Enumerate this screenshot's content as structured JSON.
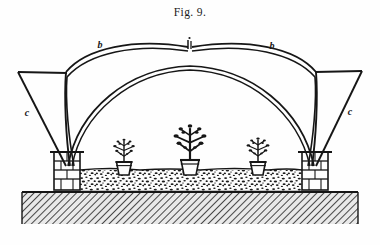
{
  "figure": {
    "caption": "Fig. 9.",
    "medium": "line-engraving",
    "ink_color": "#171717",
    "paper_color": "#fefefe"
  },
  "labels": [
    {
      "id": "b-left",
      "text": "b",
      "x": 100,
      "y": 48,
      "refers_to": "outer-arch-rib-left"
    },
    {
      "id": "b-right",
      "text": "b",
      "x": 272,
      "y": 49,
      "refers_to": "outer-arch-rib-right"
    },
    {
      "id": "c-left",
      "text": "c",
      "x": 27,
      "y": 116,
      "refers_to": "straight-strut-left"
    },
    {
      "id": "c-right",
      "text": "c",
      "x": 350,
      "y": 115,
      "refers_to": "straight-strut-right"
    }
  ],
  "structure": {
    "outer_arch_left": {
      "label": "b",
      "spring_x": 72,
      "spring_y": 165,
      "crown_x": 130,
      "crown_y": 40,
      "apex_x": 188,
      "apex_y": 48
    },
    "outer_arch_right": {
      "label": "b",
      "spring_x": 310,
      "spring_y": 165,
      "crown_x": 252,
      "crown_y": 40,
      "apex_x": 190,
      "apex_y": 48
    },
    "inner_arch": {
      "spring_left_x": 68,
      "spring_right_x": 314,
      "spring_y": 166,
      "crown_x": 190,
      "crown_y": 66
    },
    "strut_left": {
      "label": "c",
      "top_x": 18,
      "top_y": 72,
      "bottom_x": 66,
      "bottom_y": 166
    },
    "strut_right": {
      "label": "c",
      "top_x": 362,
      "top_y": 71,
      "bottom_x": 316,
      "bottom_y": 166
    },
    "finial": {
      "x": 188,
      "y": 40,
      "height": 9
    }
  },
  "piers": [
    {
      "id": "pier-left",
      "x": 54,
      "y": 152,
      "width": 26,
      "height": 38,
      "courses": 4,
      "material": "brick"
    },
    {
      "id": "pier-right",
      "x": 302,
      "y": 152,
      "width": 26,
      "height": 38,
      "courses": 4,
      "material": "brick"
    }
  ],
  "bed": {
    "id": "gravel-bed",
    "x": 80,
    "y": 170,
    "width": 222,
    "height": 22,
    "texture": "stipple-gravel"
  },
  "ground": {
    "id": "ground-band",
    "x": 22,
    "y": 192,
    "width": 336,
    "height": 32,
    "texture": "diagonal-hatch"
  },
  "plants": [
    {
      "id": "plant-1",
      "pot_center_x": 124,
      "pot_top_y": 162,
      "pot_width": 15,
      "pot_height": 13,
      "crown_height": 26,
      "size": "small"
    },
    {
      "id": "plant-2",
      "pot_center_x": 190,
      "pot_top_y": 160,
      "pot_width": 18,
      "pot_height": 15,
      "crown_height": 38,
      "size": "large"
    },
    {
      "id": "plant-3",
      "pot_center_x": 258,
      "pot_top_y": 162,
      "pot_width": 15,
      "pot_height": 13,
      "crown_height": 27,
      "size": "small"
    }
  ]
}
